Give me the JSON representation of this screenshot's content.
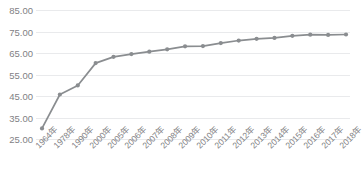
{
  "chart_data": {
    "type": "line",
    "title": "",
    "subtitle": "",
    "xlabel": "",
    "ylabel": "",
    "grid": true,
    "legend": false,
    "legend_position": "none",
    "ylim": [
      25.0,
      85.0
    ],
    "yticks": [
      "25.00",
      "35.00",
      "45.00",
      "55.00",
      "65.00",
      "75.00",
      "85.00"
    ],
    "ytick_values": [
      25.0,
      35.0,
      45.0,
      55.0,
      65.0,
      75.0,
      85.0
    ],
    "categories": [
      "1964年",
      "1978年",
      "1990年",
      "2000年",
      "2005年",
      "2006年",
      "2007年",
      "2008年",
      "2009年",
      "2010年",
      "2011年",
      "2012年",
      "2013年",
      "2014年",
      "2015年",
      "2016年",
      "2017年",
      "2018年"
    ],
    "values": [
      29.9,
      45.7,
      49.9,
      60.3,
      63.2,
      64.5,
      65.6,
      66.7,
      68.1,
      68.2,
      69.6,
      70.8,
      71.6,
      72.0,
      73.0,
      73.5,
      73.4,
      73.6
    ],
    "series": [
      {
        "name": "系列1",
        "color": "#8a8d90",
        "marker": "circle",
        "values": [
          29.9,
          45.7,
          49.9,
          60.3,
          63.2,
          64.5,
          65.6,
          66.7,
          68.1,
          68.2,
          69.6,
          70.8,
          71.6,
          72.0,
          73.0,
          73.5,
          73.4,
          73.6
        ]
      }
    ],
    "colors": {
      "line": "#8a8d90",
      "marker": "#8a8d90",
      "gridline": "#e9eaec",
      "tick_text": "#7f8184",
      "background": "#ffffff"
    }
  }
}
